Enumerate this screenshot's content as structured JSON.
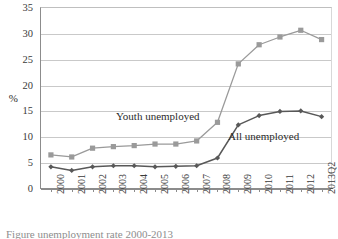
{
  "chart_data": {
    "type": "line",
    "title": "",
    "xlabel": "",
    "ylabel": "%",
    "ylim": [
      0,
      35
    ],
    "ytick_step": 5,
    "yticks": [
      0,
      5,
      10,
      15,
      20,
      25,
      30,
      35
    ],
    "grid": "horizontal",
    "legend_position": "inline-annotations",
    "categories": [
      "2000",
      "2001",
      "2002",
      "2003",
      "2004",
      "2005",
      "2006",
      "2007",
      "2008",
      "2009",
      "2010",
      "2011",
      "2012",
      "2013Q2"
    ],
    "series": [
      {
        "name": "Youth unemployed",
        "color": "#9a9a9a",
        "marker": "square",
        "values": [
          6.4,
          6.0,
          7.7,
          8.0,
          8.2,
          8.5,
          8.5,
          9.1,
          12.7,
          24.0,
          27.7,
          29.2,
          30.5,
          28.7
        ]
      },
      {
        "name": "All unemployed",
        "color": "#585858",
        "marker": "diamond",
        "values": [
          4.1,
          3.4,
          4.1,
          4.3,
          4.3,
          4.1,
          4.2,
          4.3,
          5.8,
          12.2,
          14.0,
          14.8,
          14.9,
          13.8
        ]
      }
    ],
    "annotations": [
      {
        "text": "Youth unemployed",
        "series": "Youth unemployed"
      },
      {
        "text": "All unemployed",
        "series": "All unemployed"
      }
    ]
  },
  "axis": {
    "y_title": "%",
    "y_tick_labels": [
      "35",
      "30",
      "25",
      "20",
      "15",
      "10",
      "5",
      "0"
    ],
    "x_tick_labels": [
      "2000",
      "2001",
      "2002",
      "2003",
      "2004",
      "2005",
      "2006",
      "2007",
      "2008",
      "2009",
      "2010",
      "2011",
      "2012",
      "2013Q2"
    ]
  },
  "annotations": {
    "youth_label": "Youth unemployed",
    "all_label": "All unemployed"
  },
  "caption": {
    "clipped_text": "Figure unemployment rate 2000-2013"
  },
  "colors": {
    "youth": "#9a9a9a",
    "all": "#585858",
    "grid": "#c9c9c9",
    "axis": "#8c8c8c",
    "text": "#3a3a3a",
    "background": "#ffffff"
  }
}
